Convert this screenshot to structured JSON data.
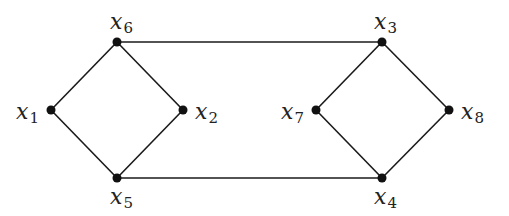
{
  "diagram": {
    "type": "graph",
    "nodes": [
      {
        "id": "x1",
        "var": "x",
        "sub": "1",
        "cx": 51,
        "cy": 110,
        "lx": 16,
        "ly": 119
      },
      {
        "id": "x2",
        "var": "x",
        "sub": "2",
        "cx": 183,
        "cy": 110,
        "lx": 195,
        "ly": 119
      },
      {
        "id": "x3",
        "var": "x",
        "sub": "3",
        "cx": 382,
        "cy": 42,
        "lx": 374,
        "ly": 29
      },
      {
        "id": "x4",
        "var": "x",
        "sub": "4",
        "cx": 382,
        "cy": 178,
        "lx": 374,
        "ly": 204
      },
      {
        "id": "x5",
        "var": "x",
        "sub": "5",
        "cx": 117,
        "cy": 178,
        "lx": 110,
        "ly": 204
      },
      {
        "id": "x6",
        "var": "x",
        "sub": "6",
        "cx": 117,
        "cy": 42,
        "lx": 110,
        "ly": 29
      },
      {
        "id": "x7",
        "var": "x",
        "sub": "7",
        "cx": 316,
        "cy": 110,
        "lx": 281,
        "ly": 119
      },
      {
        "id": "x8",
        "var": "x",
        "sub": "8",
        "cx": 449,
        "cy": 110,
        "lx": 461,
        "ly": 119
      }
    ],
    "edges": [
      [
        "x6",
        "x1"
      ],
      [
        "x6",
        "x2"
      ],
      [
        "x1",
        "x5"
      ],
      [
        "x2",
        "x5"
      ],
      [
        "x3",
        "x7"
      ],
      [
        "x3",
        "x8"
      ],
      [
        "x7",
        "x4"
      ],
      [
        "x8",
        "x4"
      ],
      [
        "x6",
        "x3"
      ],
      [
        "x5",
        "x4"
      ]
    ],
    "colors": {
      "edge": "#1a1a1a",
      "node": "#111111",
      "label": "#222222",
      "background": "#ffffff"
    }
  }
}
